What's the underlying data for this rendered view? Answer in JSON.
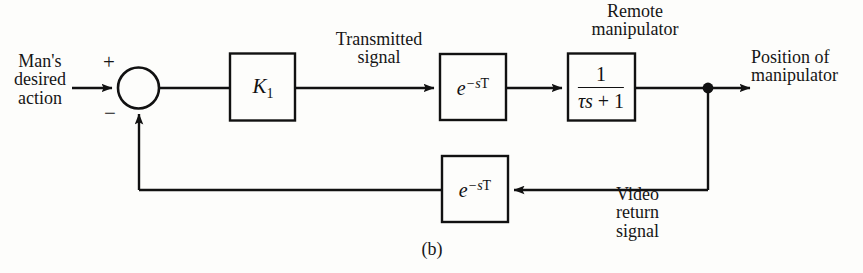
{
  "figure": {
    "caption": "(b)"
  },
  "labels": {
    "input": "Man's\ndesired\naction",
    "transmitted_signal": "Transmitted\nsignal",
    "remote_manipulator": "Remote\nmanipulator",
    "output": "Position of\nmanipulator",
    "video_return": "Video\nreturn\nsignal"
  },
  "summing_junction": {
    "plus_sign": "+",
    "minus_sign": "−"
  },
  "blocks": {
    "gain": {
      "label": "K",
      "subscript": "1"
    },
    "forward_delay": {
      "base": "e",
      "exponent_minus": "−",
      "exponent_s": "s",
      "exponent_T": "T"
    },
    "feedback_delay": {
      "base": "e",
      "exponent_minus": "−",
      "exponent_s": "s",
      "exponent_T": "T"
    },
    "plant": {
      "numerator": "1",
      "denominator_tau": "τs",
      "denominator_op": "+",
      "denominator_one": "1"
    }
  },
  "colors": {
    "background": "#fdfdfb",
    "line": "#111111",
    "text": "#161616"
  }
}
